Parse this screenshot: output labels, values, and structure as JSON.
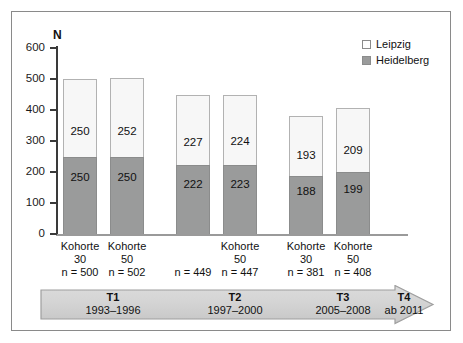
{
  "chart_data": {
    "type": "bar",
    "subtype": "stacked-bar",
    "title": "",
    "xlabel": "",
    "ylabel": "N",
    "ylim": [
      0,
      600
    ],
    "yticks": [
      0,
      100,
      200,
      300,
      400,
      500,
      600
    ],
    "grid": false,
    "legend_position": "top-right",
    "categories": [
      "Kohorte 30\nn = 500",
      "Kohorte 50\nn = 502",
      "n = 449",
      "Kohorte 50\nn = 447",
      "Kohorte 30\nn = 381",
      "Kohorte 50\nn = 408"
    ],
    "series": [
      {
        "name": "Heidelberg",
        "color": "#9a9b9b",
        "values": [
          250,
          250,
          222,
          223,
          188,
          199
        ]
      },
      {
        "name": "Leipzig",
        "color": "#f7f7f7",
        "values": [
          250,
          252,
          227,
          224,
          193,
          209
        ]
      }
    ],
    "totals": [
      500,
      502,
      449,
      447,
      381,
      408
    ],
    "annotations": [
      {
        "label": "T1",
        "period": "1993–1996"
      },
      {
        "label": "T2",
        "period": "1997–2000"
      },
      {
        "label": "T3",
        "period": "2005–2008"
      },
      {
        "label": "T4",
        "period": "ab 2011"
      }
    ]
  },
  "axis": {
    "y_label": "N",
    "y_ticks": [
      "600",
      "500",
      "400",
      "300",
      "200",
      "100",
      "0"
    ]
  },
  "legend": {
    "items": [
      {
        "label": "Leipzig",
        "swatch": "leipzig-swatch"
      },
      {
        "label": "Heidelberg",
        "swatch": "heidelberg-swatch"
      }
    ]
  },
  "bars": [
    {
      "top_value": "250",
      "bottom_value": "250",
      "cohort_line1": "Kohorte",
      "cohort_line2": "30",
      "n_text": "n = 500",
      "total": 500,
      "heidelberg": 250,
      "leipzig": 250
    },
    {
      "top_value": "252",
      "bottom_value": "250",
      "cohort_line1": "Kohorte",
      "cohort_line2": "50",
      "n_text": "n = 502",
      "total": 502,
      "heidelberg": 250,
      "leipzig": 252
    },
    {
      "top_value": "227",
      "bottom_value": "222",
      "cohort_line1": "",
      "cohort_line2": "",
      "n_text": "n = 449",
      "total": 449,
      "heidelberg": 222,
      "leipzig": 227
    },
    {
      "top_value": "224",
      "bottom_value": "223",
      "cohort_line1": "Kohorte",
      "cohort_line2": "50",
      "n_text": "n = 447",
      "total": 447,
      "heidelberg": 223,
      "leipzig": 224
    },
    {
      "top_value": "193",
      "bottom_value": "188",
      "cohort_line1": "Kohorte",
      "cohort_line2": "30",
      "n_text": "n = 381",
      "total": 381,
      "heidelberg": 188,
      "leipzig": 193
    },
    {
      "top_value": "209",
      "bottom_value": "199",
      "cohort_line1": "Kohorte",
      "cohort_line2": "50",
      "n_text": "n = 408",
      "total": 408,
      "heidelberg": 199,
      "leipzig": 209
    }
  ],
  "timeline": {
    "items": [
      {
        "phase": "T1",
        "years": "1993–1996"
      },
      {
        "phase": "T2",
        "years": "1997–2000"
      },
      {
        "phase": "T3",
        "years": "2005–2008"
      },
      {
        "phase": "T4",
        "years": "ab 2011"
      }
    ]
  },
  "colors": {
    "heidelberg": "#9a9b9b",
    "leipzig": "#f7f7f7",
    "bar_border": "#8b8c8c",
    "axis": "#3a3a3a",
    "frame": "#8a8a8a",
    "timeline_fill": "#d2d2d2",
    "timeline_stroke": "#9a9a9a"
  }
}
